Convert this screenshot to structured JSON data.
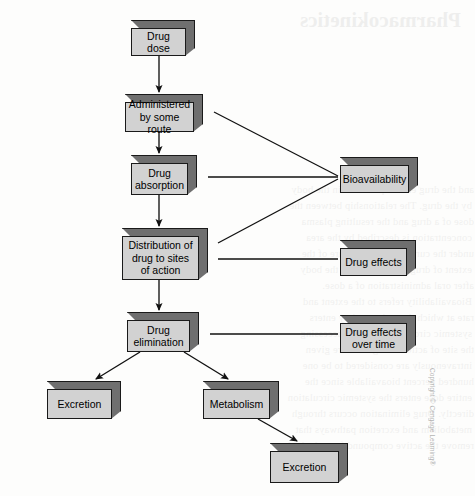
{
  "diagram": {
    "type": "flowchart",
    "nodes": [
      {
        "id": "drug_dose",
        "label": "Drug dose",
        "x": 131,
        "y": 20,
        "w": 64,
        "h": 36
      },
      {
        "id": "administered",
        "label": "Administered\nby some route",
        "x": 125,
        "y": 94,
        "w": 78,
        "h": 38
      },
      {
        "id": "absorption",
        "label": "Drug\nabsorption",
        "x": 131,
        "y": 155,
        "w": 66,
        "h": 40
      },
      {
        "id": "distribution",
        "label": "Distribution of\ndrug to sites\nof action",
        "x": 122,
        "y": 228,
        "w": 86,
        "h": 52
      },
      {
        "id": "elimination",
        "label": "Drug\nelimination",
        "x": 127,
        "y": 312,
        "w": 72,
        "h": 40
      },
      {
        "id": "excretion_left",
        "label": "Excretion",
        "x": 47,
        "y": 381,
        "w": 74,
        "h": 38
      },
      {
        "id": "metabolism",
        "label": "Metabolism",
        "x": 203,
        "y": 381,
        "w": 76,
        "h": 38
      },
      {
        "id": "excretion_bottom",
        "label": "Excretion",
        "x": 270,
        "y": 443,
        "w": 78,
        "h": 40
      },
      {
        "id": "bioavailability",
        "label": "Bioavailability",
        "x": 340,
        "y": 157,
        "w": 78,
        "h": 36
      },
      {
        "id": "drug_effects",
        "label": "Drug effects",
        "x": 340,
        "y": 240,
        "w": 76,
        "h": 36
      },
      {
        "id": "effects_over_time",
        "label": "Drug effects\nover time",
        "x": 340,
        "y": 315,
        "w": 76,
        "h": 38
      }
    ],
    "edges": [
      {
        "from": "drug_dose",
        "to": "administered",
        "style": "arrow"
      },
      {
        "from": "administered",
        "to": "absorption",
        "style": "arrow"
      },
      {
        "from": "absorption",
        "to": "distribution",
        "style": "arrow"
      },
      {
        "from": "distribution",
        "to": "elimination",
        "style": "arrow"
      },
      {
        "from": "elimination",
        "to": "excretion_left",
        "style": "arrow"
      },
      {
        "from": "elimination",
        "to": "metabolism",
        "style": "arrow"
      },
      {
        "from": "metabolism",
        "to": "excretion_bottom",
        "style": "arrow"
      },
      {
        "from": "administered",
        "to": "bioavailability",
        "style": "line"
      },
      {
        "from": "absorption",
        "to": "bioavailability",
        "style": "line"
      },
      {
        "from": "distribution",
        "to": "bioavailability",
        "style": "line"
      },
      {
        "from": "distribution",
        "to": "drug_effects",
        "style": "line"
      },
      {
        "from": "elimination",
        "to": "effects_over_time",
        "style": "line"
      }
    ],
    "colors": {
      "box_face": "#d2d2d2",
      "box_shade": "#6f6f6f",
      "outline": "#1a1a1a",
      "background": "#fdfdfc"
    }
  },
  "credit": {
    "text": "Copyright © Cengage Learning®"
  },
  "bleed_through": {
    "heading": "Pharmacokinetics",
    "lines": [
      "and the drug effects produced in the body",
      "by the drug. The relationship between the",
      "dose of a drug and the resulting plasma",
      "concentration is described by the area",
      "under the curve and is a measure of the",
      "extent of drug absorption into the body",
      "after oral administration of a dose.",
      "Bioavailability refers to the extent and",
      "rate at which the active moiety enters",
      "systemic circulation, thereby accessing",
      "the site of action. Drugs that are given",
      "intravenously are considered to be one",
      "hundred percent bioavailable since the",
      "entire dose enters the systemic circulation",
      "directly. Drug elimination occurs through",
      "metabolism and excretion pathways that",
      "remove the active compound from the body."
    ]
  }
}
